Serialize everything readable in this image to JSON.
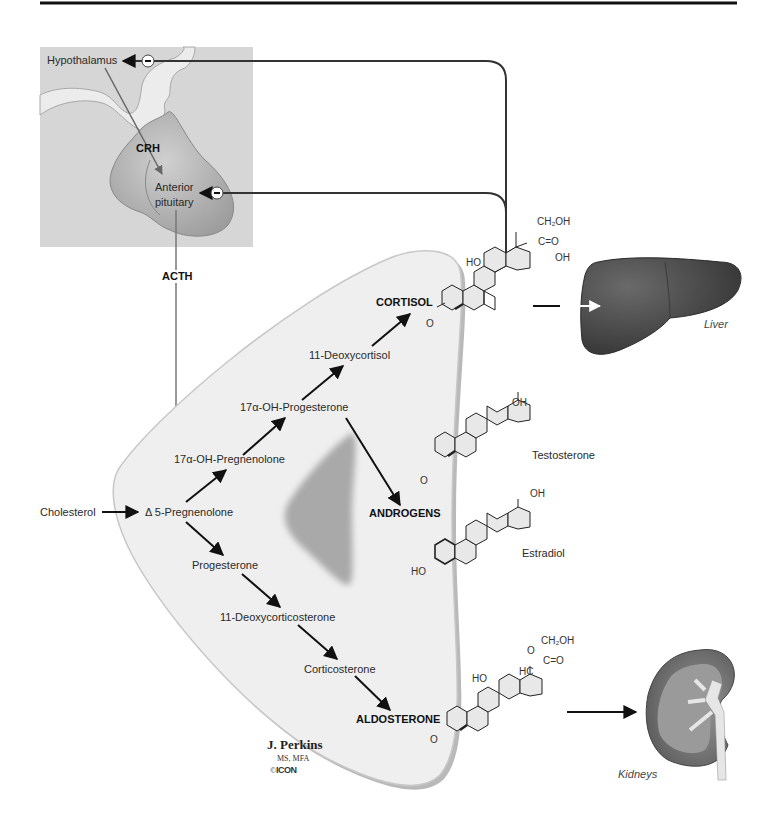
{
  "colors": {
    "frame_bg": "#d6d6d6",
    "pituitary_fill": "#b8b8b8",
    "stalk_fill": "#ececec",
    "adrenal_fill": "#efefef",
    "adrenal_shadow": "#b9b9b9",
    "inner_core": "#a9a9a9",
    "liver": "#4a4a4a",
    "kidney_outer": "#5a5a5a",
    "kidney_inner": "#9a9a9a",
    "arrow": "#111111",
    "feedback_line": "#333333",
    "hormone_line": "#777777"
  },
  "brain": {
    "hypothalamus": "Hypothalamus",
    "crh": "CRH",
    "anterior_pituitary_line1": "Anterior",
    "anterior_pituitary_line2": "pituitary",
    "inhibit_symbol": "−",
    "acth": "ACTH"
  },
  "pathway": {
    "cholesterol": "Cholesterol",
    "pregnenolone": "Δ 5-Pregnenolone",
    "oh_pregnenolone": "17α-OH-Pregnenolone",
    "oh_progesterone": "17α-OH-Progesterone",
    "deoxycortisol": "11-Deoxycortisol",
    "cortisol": "CORTISOL",
    "androgens": "ANDROGENS",
    "progesterone": "Progesterone",
    "deoxycorticosterone": "11-Deoxycorticosterone",
    "corticosterone": "Corticosterone",
    "aldosterone": "ALDOSTERONE"
  },
  "structures": {
    "cortisol": {
      "ch2oh": "CH₂OH",
      "co": "C=O",
      "oh": "OH",
      "ho": "HO",
      "o": "O"
    },
    "testosterone": {
      "name": "Testosterone",
      "oh": "OH",
      "o": "O"
    },
    "estradiol": {
      "name": "Estradiol",
      "oh": "OH",
      "ho": "HO"
    },
    "aldosterone": {
      "ch2oh": "CH₂OH",
      "co": "C=O",
      "o_top": "O",
      "hc": "HC",
      "ho": "HO",
      "o": "O"
    }
  },
  "organs": {
    "liver": "Liver",
    "kidneys": "Kidneys"
  },
  "signature": {
    "name": "J. Perkins",
    "credentials": "MS, MFA",
    "copyright": "©",
    "logo": "ICON"
  }
}
